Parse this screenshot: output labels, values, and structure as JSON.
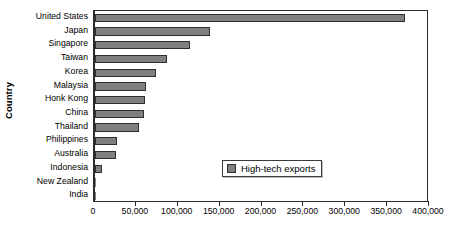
{
  "chart_data": {
    "type": "bar",
    "orientation": "horizontal",
    "title": "",
    "xlabel": "",
    "ylabel": "Country",
    "xlim": [
      0,
      400000
    ],
    "ylim": null,
    "grid": false,
    "legend_position": "inside-lower-right",
    "categories": [
      "United States",
      "Japan",
      "Singapore",
      "Taiwan",
      "Korea",
      "Malaysia",
      "Honk Kong",
      "China",
      "Thailand",
      "Philippines",
      "Australia",
      "Indonesia",
      "New Zealand",
      "India"
    ],
    "series": [
      {
        "name": "High-tech exports",
        "color": "#808080",
        "values": [
          370000,
          137000,
          113000,
          86000,
          73000,
          61000,
          60000,
          58000,
          52000,
          26000,
          25000,
          8000,
          1000,
          500
        ]
      }
    ],
    "xticks": [
      0,
      50000,
      100000,
      150000,
      200000,
      250000,
      300000,
      350000,
      400000
    ],
    "xticklabels": [
      "0",
      "50,000",
      "100,000",
      "150,000",
      "200,000",
      "250,000",
      "300,000",
      "350,000",
      "400,000"
    ]
  },
  "axes": {
    "y_title": "Country"
  },
  "legend": {
    "entries": [
      {
        "label": "High-tech exports",
        "color": "#808080"
      }
    ]
  }
}
